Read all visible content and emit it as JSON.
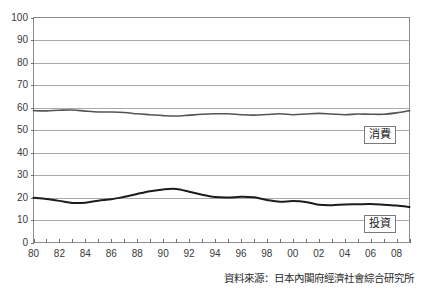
{
  "chart_data": {
    "type": "line",
    "title": "",
    "subtitle": "",
    "xlabel": "",
    "ylabel": "",
    "xlim": [
      1980,
      2009
    ],
    "ylim": [
      0,
      100
    ],
    "grid": true,
    "grid_axis": "y",
    "legend_position": "inline-right",
    "x": [
      1980,
      1981,
      1982,
      1983,
      1984,
      1985,
      1986,
      1987,
      1988,
      1989,
      1990,
      1991,
      1992,
      1993,
      1994,
      1995,
      1996,
      1997,
      1998,
      1999,
      2000,
      2001,
      2002,
      2003,
      2004,
      2005,
      2006,
      2007,
      2008,
      2009
    ],
    "x_tick_labels": [
      "80",
      "82",
      "84",
      "86",
      "88",
      "90",
      "92",
      "94",
      "96",
      "98",
      "00",
      "02",
      "04",
      "06",
      "08"
    ],
    "x_tick_values": [
      1980,
      1982,
      1984,
      1986,
      1988,
      1990,
      1992,
      1994,
      1996,
      1998,
      2000,
      2002,
      2004,
      2006,
      2008
    ],
    "y_tick_labels": [
      "0",
      "10",
      "20",
      "30",
      "40",
      "50",
      "60",
      "70",
      "80",
      "90",
      "100"
    ],
    "y_tick_values": [
      0,
      10,
      20,
      30,
      40,
      50,
      60,
      70,
      80,
      90,
      100
    ],
    "series": [
      {
        "name": "消費",
        "label": "消費",
        "color": "#545454",
        "line_width": 1.6,
        "values": [
          58.6,
          58.5,
          58.8,
          58.9,
          58.4,
          58.0,
          58.0,
          57.8,
          57.2,
          56.8,
          56.4,
          56.2,
          56.6,
          57.0,
          57.2,
          57.2,
          56.8,
          56.6,
          56.9,
          57.2,
          56.8,
          57.1,
          57.4,
          57.1,
          56.8,
          57.1,
          57.0,
          57.0,
          57.6,
          58.6
        ]
      },
      {
        "name": "投資",
        "label": "投資",
        "color": "#1c1c1c",
        "line_width": 2.0,
        "values": [
          19.9,
          19.3,
          18.5,
          17.6,
          17.7,
          18.6,
          19.2,
          20.3,
          21.6,
          22.8,
          23.6,
          23.8,
          22.6,
          21.2,
          20.2,
          20.0,
          20.3,
          20.1,
          18.9,
          18.1,
          18.4,
          18.0,
          16.8,
          16.6,
          16.9,
          17.0,
          17.1,
          16.8,
          16.4,
          15.8
        ]
      }
    ]
  },
  "axis": {
    "y_labels": [
      "100",
      "90",
      "80",
      "70",
      "60",
      "50",
      "40",
      "30",
      "20",
      "10",
      "0"
    ],
    "x_labels": [
      "80",
      "82",
      "84",
      "86",
      "88",
      "90",
      "92",
      "94",
      "96",
      "98",
      "00",
      "02",
      "04",
      "06",
      "08"
    ]
  },
  "legend": {
    "consumption_tag": "消費",
    "investment_tag": "投資"
  },
  "footer": {
    "source": "資料來源：日本內閣府經濟社會綜合研究所"
  }
}
